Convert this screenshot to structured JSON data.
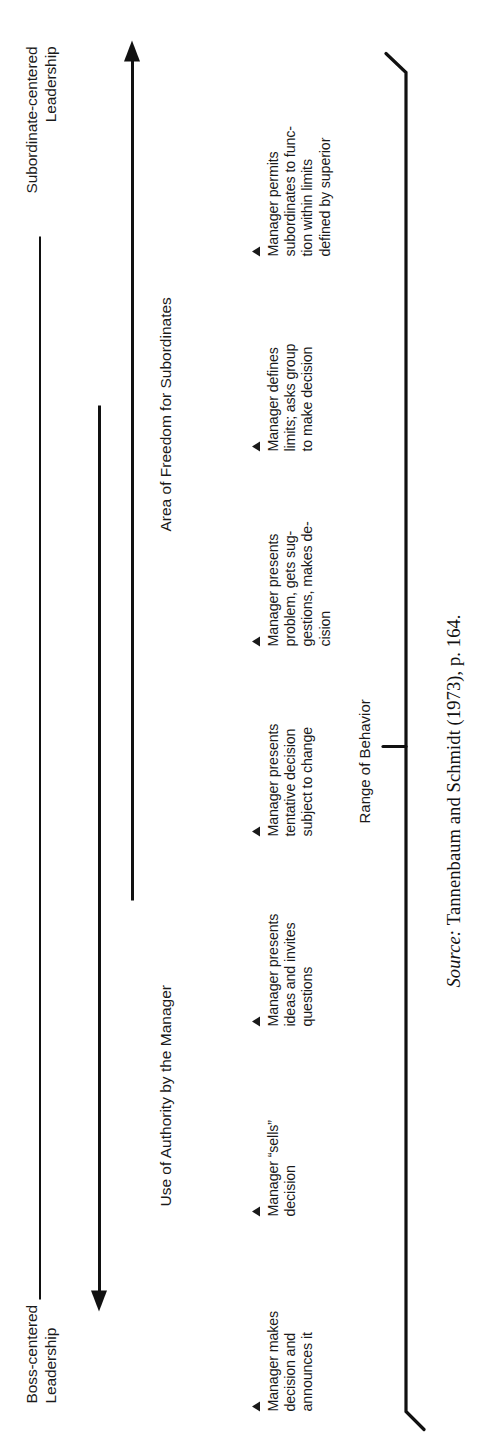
{
  "figure": {
    "type": "continuum-diagram",
    "title_left": "Boss-centered\nLeadership",
    "left_label_line1": "Boss-centered",
    "left_label_line2": "Leadership",
    "right_label_line1": "Subordinate-centered",
    "right_label_line2": "Leadership",
    "axis_labels": {
      "authority": "Use of Authority by the Manager",
      "freedom": "Area of Freedom for Subordinates"
    },
    "range_caption": "Range of Behavior",
    "marker_glyph": "triangle-up"
  },
  "columns": [
    {
      "id": "c1",
      "lines": [
        "Manager makes",
        "decision and",
        "announces it"
      ],
      "text": "Manager makes decision and announces it"
    },
    {
      "id": "c2",
      "lines": [
        "Manager “sells”",
        "decision"
      ],
      "text": "Manager “sells” decision"
    },
    {
      "id": "c3",
      "lines": [
        "Manager presents",
        "ideas and invites",
        "questions"
      ],
      "text": "Manager presents ideas and invites questions"
    },
    {
      "id": "c4",
      "lines": [
        "Manager presents",
        "tentative decision",
        "subject to change"
      ],
      "text": "Manager presents tentative decision subject to change"
    },
    {
      "id": "c5",
      "lines": [
        "Manager presents",
        "problem, gets sug-",
        "gestions, makes de-",
        "cision"
      ],
      "text": "Manager presents problem, gets suggestions, makes decision"
    },
    {
      "id": "c6",
      "lines": [
        "Manager defines",
        "limits; asks group",
        "to make decision"
      ],
      "text": "Manager defines limits; asks group to make decision"
    },
    {
      "id": "c7",
      "lines": [
        "Manager permits",
        "subordinates to func-",
        "tion within limits",
        "defined by superior"
      ],
      "text": "Manager permits subordinates to function within limits defined by superior"
    }
  ],
  "source": {
    "prefix": "Source:",
    "citation": "Tannenbaum and Schmidt (1973), p. 164.",
    "full": "Source: Tannenbaum and Schmidt (1973), p. 164."
  },
  "colors": {
    "ink": "#1a1a1a",
    "line": "#111111",
    "background": "#ffffff"
  }
}
